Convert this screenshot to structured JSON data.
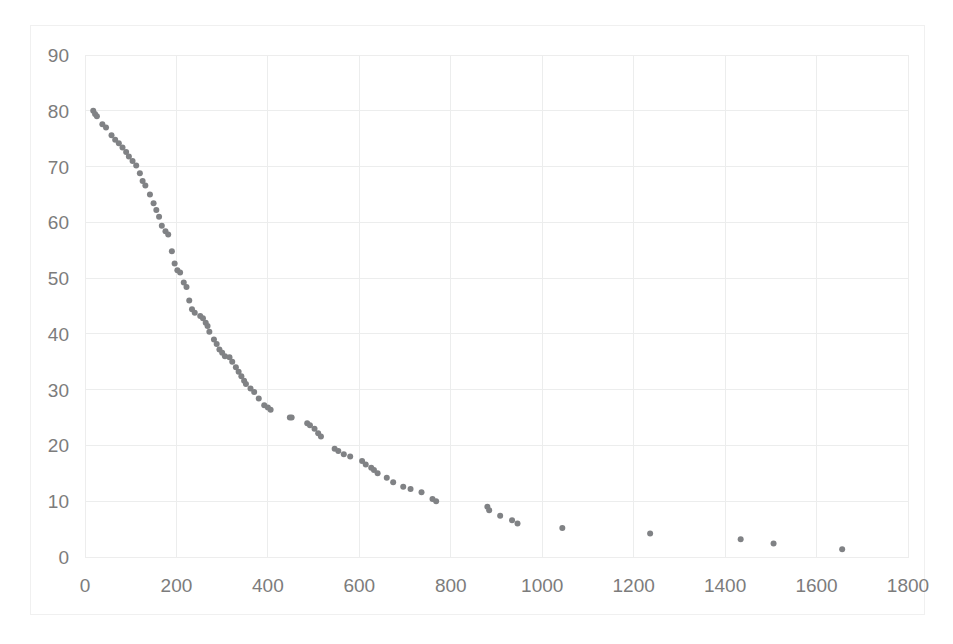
{
  "chart_data": {
    "type": "scatter",
    "title": "",
    "subtitle": "",
    "xlabel": "",
    "ylabel": "",
    "xlim": [
      0,
      1800
    ],
    "ylim": [
      0,
      90
    ],
    "x_ticks": [
      0,
      200,
      400,
      600,
      800,
      1000,
      1200,
      1400,
      1600,
      1800
    ],
    "y_ticks": [
      0,
      10,
      20,
      30,
      40,
      50,
      60,
      70,
      80,
      90
    ],
    "grid": true,
    "legend": null,
    "legend_position": "none",
    "marker": {
      "shape": "circle",
      "color": "#808285",
      "size": 6
    },
    "series": [
      {
        "name": "series-1",
        "points": [
          [
            18,
            80.0
          ],
          [
            22,
            79.4
          ],
          [
            26,
            79.0
          ],
          [
            38,
            77.6
          ],
          [
            46,
            77.0
          ],
          [
            58,
            75.6
          ],
          [
            66,
            74.8
          ],
          [
            74,
            74.2
          ],
          [
            82,
            73.4
          ],
          [
            90,
            72.6
          ],
          [
            96,
            71.8
          ],
          [
            104,
            71.0
          ],
          [
            112,
            70.2
          ],
          [
            120,
            68.8
          ],
          [
            126,
            67.4
          ],
          [
            132,
            66.6
          ],
          [
            142,
            65.0
          ],
          [
            150,
            63.4
          ],
          [
            156,
            62.2
          ],
          [
            162,
            61.0
          ],
          [
            168,
            59.4
          ],
          [
            176,
            58.4
          ],
          [
            182,
            57.8
          ],
          [
            190,
            54.8
          ],
          [
            196,
            52.6
          ],
          [
            202,
            51.4
          ],
          [
            208,
            51.0
          ],
          [
            216,
            49.2
          ],
          [
            222,
            48.4
          ],
          [
            228,
            46.0
          ],
          [
            234,
            44.4
          ],
          [
            240,
            43.8
          ],
          [
            252,
            43.2
          ],
          [
            258,
            42.8
          ],
          [
            264,
            42.0
          ],
          [
            268,
            41.4
          ],
          [
            272,
            40.4
          ],
          [
            282,
            39.0
          ],
          [
            288,
            38.2
          ],
          [
            294,
            37.2
          ],
          [
            300,
            36.6
          ],
          [
            306,
            36.0
          ],
          [
            316,
            35.8
          ],
          [
            322,
            35.0
          ],
          [
            330,
            34.0
          ],
          [
            336,
            33.2
          ],
          [
            342,
            32.4
          ],
          [
            348,
            31.6
          ],
          [
            352,
            31.0
          ],
          [
            362,
            30.2
          ],
          [
            370,
            29.6
          ],
          [
            380,
            28.4
          ],
          [
            392,
            27.2
          ],
          [
            400,
            26.8
          ],
          [
            406,
            26.4
          ],
          [
            448,
            25.0
          ],
          [
            452,
            25.0
          ],
          [
            486,
            24.0
          ],
          [
            492,
            23.6
          ],
          [
            502,
            23.0
          ],
          [
            510,
            22.2
          ],
          [
            516,
            21.6
          ],
          [
            546,
            19.4
          ],
          [
            554,
            19.0
          ],
          [
            566,
            18.4
          ],
          [
            580,
            18.0
          ],
          [
            606,
            17.2
          ],
          [
            614,
            16.6
          ],
          [
            626,
            16.0
          ],
          [
            632,
            15.6
          ],
          [
            640,
            15.0
          ],
          [
            660,
            14.2
          ],
          [
            674,
            13.4
          ],
          [
            696,
            12.6
          ],
          [
            712,
            12.2
          ],
          [
            736,
            11.6
          ],
          [
            760,
            10.4
          ],
          [
            768,
            10.0
          ],
          [
            880,
            9.0
          ],
          [
            884,
            8.4
          ],
          [
            908,
            7.4
          ],
          [
            934,
            6.6
          ],
          [
            946,
            6.0
          ],
          [
            1044,
            5.2
          ],
          [
            1236,
            4.2
          ],
          [
            1434,
            3.2
          ],
          [
            1506,
            2.4
          ],
          [
            1656,
            1.4
          ]
        ]
      }
    ]
  }
}
